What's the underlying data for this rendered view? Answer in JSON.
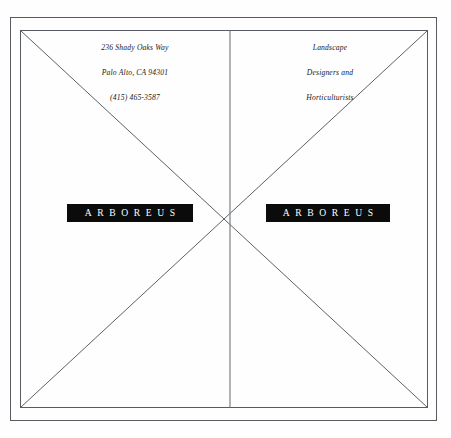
{
  "page": {
    "background_color": "#fefefe",
    "line_color": "#555b60",
    "ink_color": "#202020",
    "logo_background": "#0b0b0b",
    "logo_text_color": "#ffffff"
  },
  "address": {
    "lines": [
      "236 Shady Oaks Way",
      "Palo Alto, CA 94301",
      "(415) 465-3587"
    ]
  },
  "services": {
    "lines": [
      "Landscape",
      "Designers and",
      "Horticulturists"
    ]
  },
  "logo": {
    "left_label": "ARBOREUS",
    "right_label": "ARBOREUS"
  },
  "guides": {
    "frame_outer": {
      "x": 10,
      "y": 17,
      "width": 427,
      "height": 404
    },
    "frame_inner": {
      "x": 20,
      "y": 30,
      "width": 408,
      "height": 378
    },
    "center_vertical_x": 230,
    "diagonal_crossing": {
      "x": 230,
      "y": 218
    }
  }
}
